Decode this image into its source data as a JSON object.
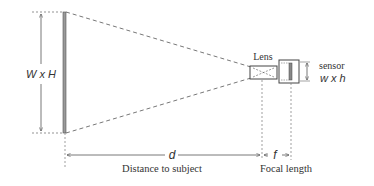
{
  "diagram": {
    "subject_label": "W x H",
    "lens_label": "Lens",
    "sensor_label": "sensor",
    "sensor_dims_label": "w x h",
    "distance_symbol": "d",
    "distance_label": "Distance to subject",
    "focal_symbol": "f",
    "focal_label": "Focal length",
    "colors": {
      "line": "#555555",
      "subject_plane": "#8a8a8a",
      "text": "#333333"
    }
  }
}
